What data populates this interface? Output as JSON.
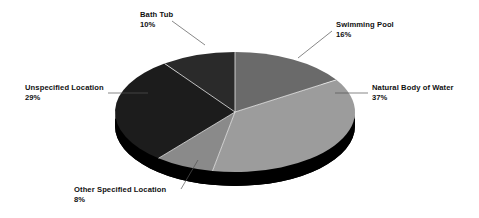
{
  "chart_data": {
    "type": "pie",
    "title": "",
    "subtitle": "",
    "xlabel": "",
    "ylabel": "",
    "legend_position": "callout-labels",
    "grid": false,
    "units": "percent",
    "total": 100,
    "categories": [
      "Swimming Pool",
      "Natural Body of Water",
      "Other Specified Location",
      "Unspecified Location",
      "Bath Tub"
    ],
    "values": [
      16,
      37,
      8,
      29,
      10
    ],
    "slices": [
      {
        "label": "Swimming Pool",
        "value": 16,
        "percent_text": "16%",
        "color": "#6a6a6a",
        "start_angle": 0,
        "end_angle": 57.6
      },
      {
        "label": "Natural Body of Water",
        "value": 37,
        "percent_text": "37%",
        "color": "#9c9c9c",
        "start_angle": 57.6,
        "end_angle": 190.8
      },
      {
        "label": "Other Specified Location",
        "value": 8,
        "percent_text": "8%",
        "color": "#8a8a8a",
        "start_angle": 190.8,
        "end_angle": 219.6
      },
      {
        "label": "Unspecified Location",
        "value": 29,
        "percent_text": "29%",
        "color": "#1c1c1c",
        "start_angle": 219.6,
        "end_angle": 324.0
      },
      {
        "label": "Bath Tub",
        "value": 10,
        "percent_text": "10%",
        "color": "#2a2a2a",
        "start_angle": 324.0,
        "end_angle": 360.0
      }
    ],
    "style": {
      "three_d": true,
      "base_color": "#000000",
      "background": "#ffffff",
      "separator_color": "#f2f2f2"
    }
  },
  "callouts": {
    "bath_tub": {
      "label": "Bath Tub",
      "percent": "10%"
    },
    "swimming_pool": {
      "label": "Swimming Pool",
      "percent": "16%"
    },
    "natural_body_of_water": {
      "label": "Natural Body of Water",
      "percent": "37%"
    },
    "unspecified_location": {
      "label": "Unspecified Location",
      "percent": "29%"
    },
    "other_specified_location": {
      "label": "Other Specified Location",
      "percent": "8%"
    }
  }
}
